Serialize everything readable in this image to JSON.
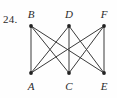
{
  "figure": {
    "problem_number": "24.",
    "caption": "",
    "background_color": "#fefefe",
    "edge_color": "#3a3a3a",
    "vertex_color": "#222222",
    "label_color": "#2b2b2b"
  },
  "chart_data": {
    "type": "diagram",
    "diagram_kind": "graph",
    "title": "24.",
    "nodes": [
      {
        "id": "B",
        "label": "B",
        "x": 31,
        "y": 26,
        "row": "top",
        "label_x": 31,
        "label_y": 8,
        "degree": 3
      },
      {
        "id": "D",
        "label": "D",
        "x": 69,
        "y": 26,
        "row": "top",
        "label_x": 69,
        "label_y": 8,
        "degree": 3
      },
      {
        "id": "F",
        "label": "F",
        "x": 104,
        "y": 26,
        "row": "top",
        "label_x": 104,
        "label_y": 8,
        "degree": 3
      },
      {
        "id": "A",
        "label": "A",
        "x": 31,
        "y": 73,
        "row": "bottom",
        "label_x": 31,
        "label_y": 80,
        "degree": 3
      },
      {
        "id": "C",
        "label": "C",
        "x": 69,
        "y": 73,
        "row": "bottom",
        "label_x": 69,
        "label_y": 80,
        "degree": 3
      },
      {
        "id": "E",
        "label": "E",
        "x": 104,
        "y": 73,
        "row": "bottom",
        "label_x": 104,
        "label_y": 80,
        "degree": 3
      }
    ],
    "edges": [
      {
        "from": "B",
        "to": "A"
      },
      {
        "from": "B",
        "to": "C"
      },
      {
        "from": "B",
        "to": "E"
      },
      {
        "from": "D",
        "to": "A"
      },
      {
        "from": "D",
        "to": "C"
      },
      {
        "from": "D",
        "to": "E"
      },
      {
        "from": "F",
        "to": "A"
      },
      {
        "from": "F",
        "to": "C"
      },
      {
        "from": "F",
        "to": "E"
      }
    ],
    "edge_count": 9,
    "node_count": 6,
    "legend": [],
    "grid": false
  }
}
